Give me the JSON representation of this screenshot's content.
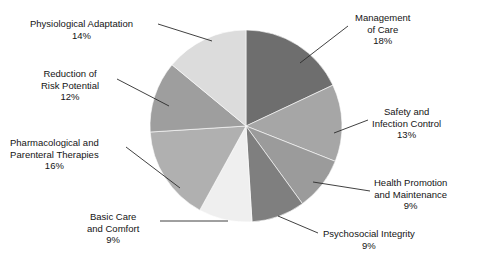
{
  "chart_data": {
    "type": "pie",
    "title": "",
    "subtitle": "",
    "xlabel": "",
    "ylabel": "",
    "legend_position": "none",
    "grid": false,
    "start_angle_deg": 90,
    "direction": "clockwise",
    "units": "percent",
    "categories": [
      "Management of Care",
      "Safety and Infection Control",
      "Health Promotion and Maintenance",
      "Psychosocial Integrity",
      "Basic Care and Comfort",
      "Pharmacological and Parenteral Therapies",
      "Reduction of Risk Potential",
      "Physiological Adaptation"
    ],
    "values": [
      18,
      13,
      9,
      9,
      9,
      16,
      12,
      14
    ],
    "value_labels": [
      "18%",
      "13%",
      "9%",
      "9%",
      "9%",
      "16%",
      "12%",
      "14%"
    ],
    "colors": [
      "#6e6e6e",
      "#a6a6a6",
      "#9b9b9b",
      "#7f7f7f",
      "#efefef",
      "#b0b0b0",
      "#9e9e9e",
      "#dcdcdc"
    ],
    "slices": [
      {
        "name": "Management of Care",
        "value": 18,
        "value_label": "18%",
        "color": "#6e6e6e",
        "label_lines": [
          "Management",
          "of Care"
        ],
        "label_side": "right"
      },
      {
        "name": "Safety and Infection Control",
        "value": 13,
        "value_label": "13%",
        "color": "#a6a6a6",
        "label_lines": [
          "Safety and",
          "Infection Control"
        ],
        "label_side": "right"
      },
      {
        "name": "Health Promotion and Maintenance",
        "value": 9,
        "value_label": "9%",
        "color": "#9b9b9b",
        "label_lines": [
          "Health Promotion",
          "and Maintenance"
        ],
        "label_side": "right"
      },
      {
        "name": "Psychosocial Integrity",
        "value": 9,
        "value_label": "9%",
        "color": "#7f7f7f",
        "label_lines": [
          "Psychosocial Integrity"
        ],
        "label_side": "right"
      },
      {
        "name": "Basic Care and Comfort",
        "value": 9,
        "value_label": "9%",
        "color": "#efefef",
        "label_lines": [
          "Basic Care",
          "and Comfort"
        ],
        "label_side": "left"
      },
      {
        "name": "Pharmacological and Parenteral Therapies",
        "value": 16,
        "value_label": "16%",
        "color": "#b0b0b0",
        "label_lines": [
          "Pharmacological and",
          "Parenteral Therapies"
        ],
        "label_side": "left"
      },
      {
        "name": "Reduction of Risk Potential",
        "value": 12,
        "value_label": "12%",
        "color": "#9e9e9e",
        "label_lines": [
          "Reduction of",
          "Risk Potential"
        ],
        "label_side": "left"
      },
      {
        "name": "Physiological Adaptation",
        "value": 14,
        "value_label": "14%",
        "color": "#dcdcdc",
        "label_lines": [
          "Physiological Adaptation"
        ],
        "label_side": "left"
      }
    ]
  },
  "labels": {
    "management_of_care": {
      "line1": "Management",
      "line2": "of Care",
      "pct": "18%"
    },
    "safety_infection_control": {
      "line1": "Safety and",
      "line2": "Infection Control",
      "pct": "13%"
    },
    "health_promotion": {
      "line1": "Health Promotion",
      "line2": "and Maintenance",
      "pct": "9%"
    },
    "psychosocial_integrity": {
      "line1": "Psychosocial Integrity",
      "pct": "9%"
    },
    "basic_care_comfort": {
      "line1": "Basic Care",
      "line2": "and Comfort",
      "pct": "9%"
    },
    "pharmacological": {
      "line1": "Pharmacological and",
      "line2": "Parenteral Therapies",
      "pct": "16%"
    },
    "reduction_risk": {
      "line1": "Reduction of",
      "line2": "Risk Potential",
      "pct": "12%"
    },
    "physiological_adaptation": {
      "line1": "Physiological Adaptation",
      "pct": "14%"
    }
  }
}
